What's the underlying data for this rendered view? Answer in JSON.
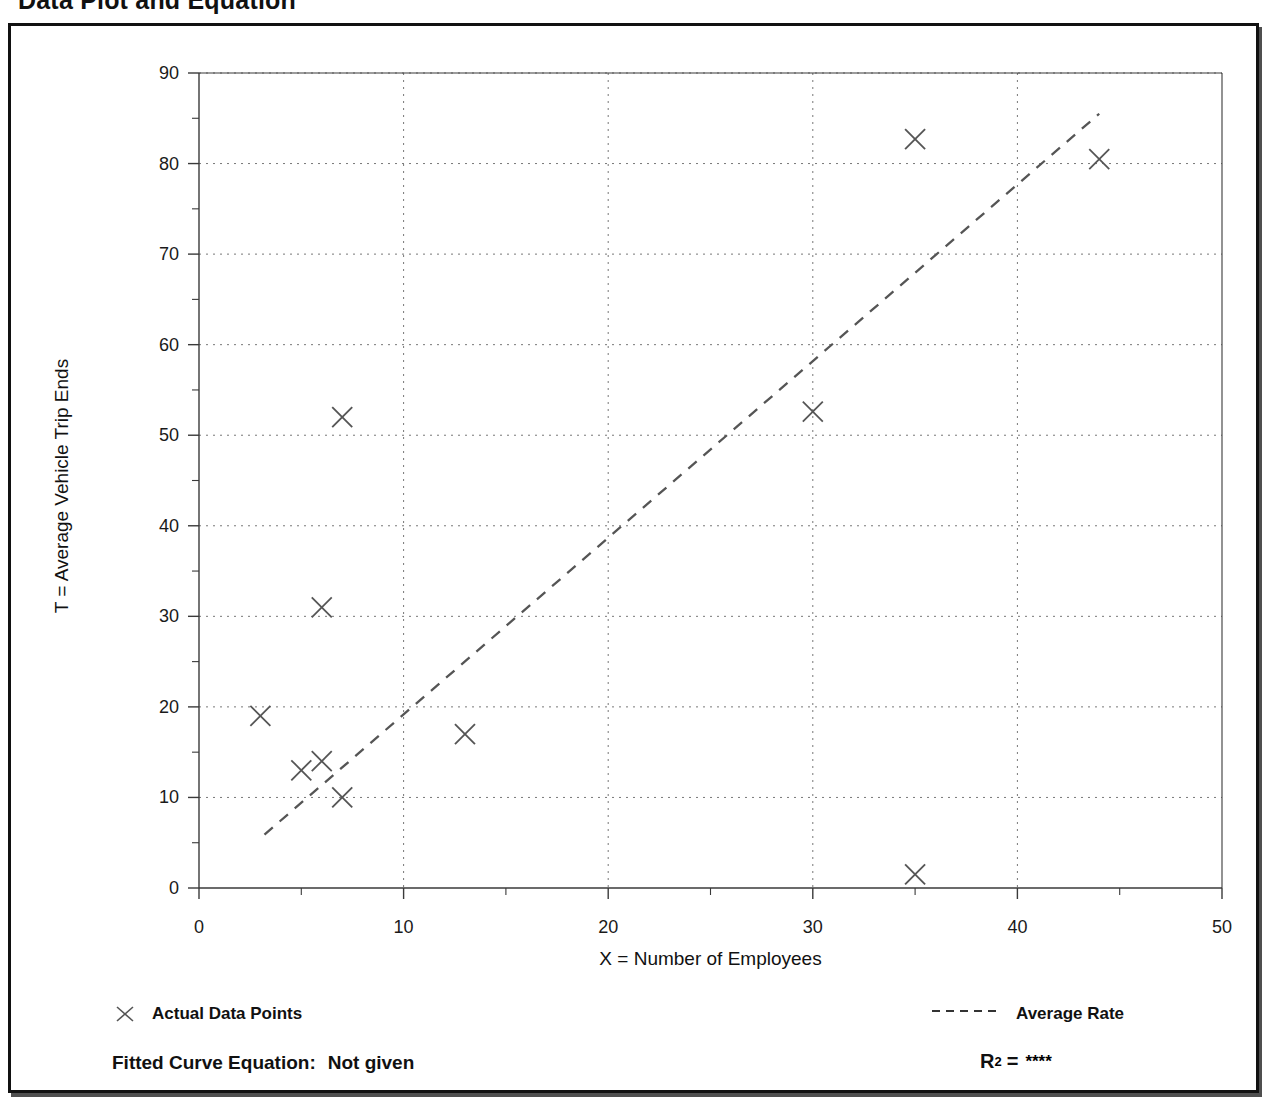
{
  "page": {
    "title": "Data Plot and Equation"
  },
  "chart_data": {
    "type": "scatter",
    "title": "Data Plot and Equation",
    "xlabel": "X = Number of Employees",
    "ylabel": "T = Average Vehicle Trip Ends",
    "xlim": [
      0,
      50
    ],
    "ylim": [
      0,
      90
    ],
    "xticks": [
      0,
      10,
      20,
      30,
      40,
      50
    ],
    "yticks": [
      0,
      10,
      20,
      30,
      40,
      50,
      60,
      70,
      80,
      90
    ],
    "xtick_labels": [
      "0",
      "10",
      "20",
      "30",
      "40",
      "50"
    ],
    "ytick_labels": [
      "0",
      "10",
      "20",
      "30",
      "40",
      "50",
      "60",
      "70",
      "80",
      "90"
    ],
    "minor_tick_step": 5,
    "grid": true,
    "grid_style": "dotted",
    "legend_position": "below-plot",
    "series": [
      {
        "name": "Actual Data Points",
        "type": "scatter",
        "marker": "x",
        "color": "#555555",
        "points": [
          {
            "x": 3,
            "y": 19
          },
          {
            "x": 5,
            "y": 13
          },
          {
            "x": 6,
            "y": 14
          },
          {
            "x": 6,
            "y": 31
          },
          {
            "x": 7,
            "y": 10
          },
          {
            "x": 7,
            "y": 52
          },
          {
            "x": 13,
            "y": 17
          },
          {
            "x": 30,
            "y": 52.6
          },
          {
            "x": 35,
            "y": 1.5
          },
          {
            "x": 35,
            "y": 82.7
          },
          {
            "x": 44,
            "y": 80.5
          }
        ]
      },
      {
        "name": "Average Rate",
        "type": "line",
        "style": "dashed",
        "color": "#555555",
        "endpoints": [
          {
            "x": 3.2,
            "y": 5.9
          },
          {
            "x": 44.0,
            "y": 85.5
          }
        ]
      }
    ],
    "annotations": {
      "fitted_curve_equation_label": "Fitted Curve Equation:",
      "fitted_curve_equation_value": "Not given",
      "r_squared_label": "R",
      "r_squared_exponent": "2",
      "r_squared_equals": "=",
      "r_squared_value": "****"
    }
  },
  "legend": {
    "points_label": "Actual Data Points",
    "line_label": "Average Rate",
    "points_marker_icon": "x-marker-icon",
    "line_marker_icon": "dashed-line-icon"
  },
  "footer": {
    "equation_label": "Fitted Curve Equation:",
    "equation_value": "Not given",
    "r2_base": "R",
    "r2_exponent": "2",
    "r2_equals": "=",
    "r2_value": "****"
  },
  "colors": {
    "frame": "#111111",
    "axis": "#3a3a3a",
    "grid": "#777777",
    "marker": "#555555",
    "text": "#111111"
  }
}
